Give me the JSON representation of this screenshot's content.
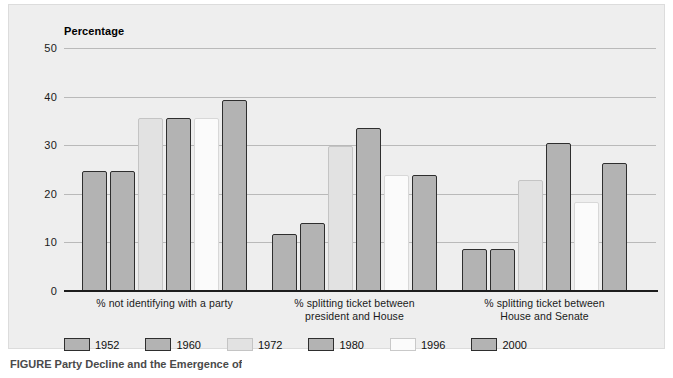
{
  "figure": {
    "caption": "FIGURE  Party Decline and the Emergence of"
  },
  "chart_data": {
    "type": "bar",
    "title": "",
    "axis_title": "Percentage",
    "xlabel": "",
    "ylabel": "Percentage",
    "ylim": [
      0,
      50
    ],
    "yticks": [
      0,
      10,
      20,
      30,
      40,
      50
    ],
    "ytick_labels": [
      "0",
      "10",
      "20",
      "30",
      "40",
      "50"
    ],
    "grid": true,
    "legend_position": "bottom",
    "categories": [
      "% not identifying with a party",
      "% splitting ticket between president and House",
      "% splitting ticket between House and Senate"
    ],
    "category_lines": [
      [
        "% not identifying with a party"
      ],
      [
        "% splitting ticket between",
        "president and House"
      ],
      [
        "% splitting ticket between",
        "House and Senate"
      ]
    ],
    "series": [
      {
        "name": "1952",
        "shade": "shade-mid",
        "color": "#b3b3b3",
        "values": [
          24.7,
          11.7,
          8.7
        ]
      },
      {
        "name": "1960",
        "shade": "shade-mid",
        "color": "#b3b3b3",
        "values": [
          24.7,
          13.9,
          8.7
        ]
      },
      {
        "name": "1972",
        "shade": "shade-light",
        "color": "#e2e2e2",
        "values": [
          35.7,
          29.9,
          22.9
        ]
      },
      {
        "name": "1980",
        "shade": "shade-mid",
        "color": "#b3b3b3",
        "values": [
          35.7,
          33.5,
          30.5
        ]
      },
      {
        "name": "1996",
        "shade": "shade-white",
        "color": "#fbfbfb",
        "values": [
          35.7,
          23.8,
          18.4
        ]
      },
      {
        "name": "2000",
        "shade": "shade-mid",
        "color": "#b3b3b3",
        "values": [
          39.3,
          23.8,
          26.4
        ]
      }
    ]
  }
}
